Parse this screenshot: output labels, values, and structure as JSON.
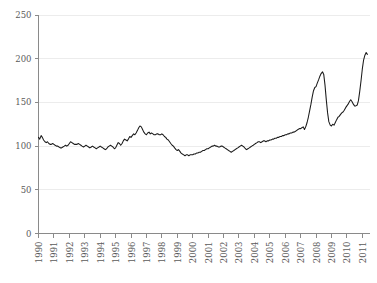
{
  "chart_data": {
    "type": "line",
    "title": "",
    "subtitle": "",
    "xlabel": "",
    "ylabel": "",
    "xlim": [
      1990,
      2011.5
    ],
    "ylim": [
      0,
      250
    ],
    "grid": true,
    "legend": "none",
    "y_ticks": [
      0,
      50,
      100,
      150,
      200,
      250
    ],
    "y_tick_labels": [
      "0",
      "50",
      "100",
      "150",
      "200",
      "250"
    ],
    "x_ticks": [
      1990,
      1991,
      1992,
      1993,
      1994,
      1995,
      1996,
      1997,
      1998,
      1999,
      2000,
      2001,
      2002,
      2003,
      2004,
      2005,
      2006,
      2007,
      2008,
      2009,
      2010,
      2011
    ],
    "x_tick_labels": [
      "1990",
      "1991",
      "1992",
      "1993",
      "1994",
      "1995",
      "1996",
      "1997",
      "1998",
      "1999",
      "2000",
      "2001",
      "2002",
      "2003",
      "2004",
      "2005",
      "2006",
      "2007",
      "2008",
      "2009",
      "2010",
      "2011"
    ],
    "series": [
      {
        "name": "index",
        "color": "#1a1a1a",
        "x": [
          1990.0,
          1990.08,
          1990.17,
          1990.25,
          1990.33,
          1990.42,
          1990.5,
          1990.58,
          1990.67,
          1990.75,
          1990.83,
          1990.92,
          1991.0,
          1991.08,
          1991.17,
          1991.25,
          1991.33,
          1991.42,
          1991.5,
          1991.58,
          1991.67,
          1991.75,
          1991.83,
          1991.92,
          1992.0,
          1992.08,
          1992.17,
          1992.25,
          1992.33,
          1992.42,
          1992.5,
          1992.58,
          1992.67,
          1992.75,
          1992.83,
          1992.92,
          1993.0,
          1993.08,
          1993.17,
          1993.25,
          1993.33,
          1993.42,
          1993.5,
          1993.58,
          1993.67,
          1993.75,
          1993.83,
          1993.92,
          1994.0,
          1994.08,
          1994.17,
          1994.25,
          1994.33,
          1994.42,
          1994.5,
          1994.58,
          1994.67,
          1994.75,
          1994.83,
          1994.92,
          1995.0,
          1995.08,
          1995.17,
          1995.25,
          1995.33,
          1995.42,
          1995.5,
          1995.58,
          1995.67,
          1995.75,
          1995.83,
          1995.92,
          1996.0,
          1996.08,
          1996.17,
          1996.25,
          1996.33,
          1996.42,
          1996.5,
          1996.58,
          1996.67,
          1996.75,
          1996.83,
          1996.92,
          1997.0,
          1997.08,
          1997.17,
          1997.25,
          1997.33,
          1997.42,
          1997.5,
          1997.58,
          1997.67,
          1997.75,
          1997.83,
          1997.92,
          1998.0,
          1998.08,
          1998.17,
          1998.25,
          1998.33,
          1998.42,
          1998.5,
          1998.58,
          1998.67,
          1998.75,
          1998.83,
          1998.92,
          1999.0,
          1999.08,
          1999.17,
          1999.25,
          1999.33,
          1999.42,
          1999.5,
          1999.58,
          1999.67,
          1999.75,
          1999.83,
          1999.92,
          2000.0,
          2000.08,
          2000.17,
          2000.25,
          2000.33,
          2000.42,
          2000.5,
          2000.58,
          2000.67,
          2000.75,
          2000.83,
          2000.92,
          2001.0,
          2001.08,
          2001.17,
          2001.25,
          2001.33,
          2001.42,
          2001.5,
          2001.58,
          2001.67,
          2001.75,
          2001.83,
          2001.92,
          2002.0,
          2002.08,
          2002.17,
          2002.25,
          2002.33,
          2002.42,
          2002.5,
          2002.58,
          2002.67,
          2002.75,
          2002.83,
          2002.92,
          2003.0,
          2003.08,
          2003.17,
          2003.25,
          2003.33,
          2003.42,
          2003.5,
          2003.58,
          2003.67,
          2003.75,
          2003.83,
          2003.92,
          2004.0,
          2004.08,
          2004.17,
          2004.25,
          2004.33,
          2004.42,
          2004.5,
          2004.58,
          2004.67,
          2004.75,
          2004.83,
          2004.92,
          2005.0,
          2005.08,
          2005.17,
          2005.25,
          2005.33,
          2005.42,
          2005.5,
          2005.58,
          2005.67,
          2005.75,
          2005.83,
          2005.92,
          2006.0,
          2006.08,
          2006.17,
          2006.25,
          2006.33,
          2006.42,
          2006.5,
          2006.58,
          2006.67,
          2006.75,
          2006.83,
          2006.92,
          2007.0,
          2007.08,
          2007.17,
          2007.25,
          2007.33,
          2007.42,
          2007.5,
          2007.58,
          2007.67,
          2007.75,
          2007.83,
          2007.92,
          2008.0,
          2008.08,
          2008.17,
          2008.25,
          2008.33,
          2008.42,
          2008.5,
          2008.58,
          2008.67,
          2008.75,
          2008.83,
          2008.92,
          2009.0,
          2009.08,
          2009.17,
          2009.25,
          2009.33,
          2009.42,
          2009.5,
          2009.58,
          2009.67,
          2009.75,
          2009.83,
          2009.92,
          2010.0,
          2010.08,
          2010.17,
          2010.25,
          2010.33,
          2010.42,
          2010.5,
          2010.58,
          2010.67,
          2010.75,
          2010.83,
          2010.92,
          2011.0,
          2011.08,
          2011.17,
          2011.25,
          2011.33
        ],
        "values": [
          110,
          108,
          112,
          110,
          107,
          105,
          104,
          105,
          103,
          102,
          102,
          103,
          102,
          101,
          100,
          100,
          99,
          98,
          98,
          99,
          100,
          101,
          100,
          101,
          103,
          105,
          104,
          103,
          102,
          102,
          102,
          103,
          102,
          101,
          100,
          99,
          100,
          101,
          100,
          99,
          98,
          99,
          100,
          99,
          98,
          97,
          98,
          99,
          100,
          99,
          98,
          97,
          96,
          97,
          99,
          100,
          101,
          100,
          99,
          97,
          98,
          101,
          104,
          103,
          101,
          103,
          106,
          108,
          107,
          106,
          108,
          111,
          110,
          112,
          114,
          113,
          115,
          118,
          121,
          123,
          122,
          119,
          116,
          114,
          113,
          115,
          116,
          114,
          115,
          114,
          113,
          113,
          114,
          114,
          113,
          113,
          114,
          113,
          111,
          110,
          108,
          107,
          105,
          103,
          101,
          100,
          98,
          96,
          95,
          96,
          94,
          92,
          91,
          90,
          89,
          90,
          90,
          89,
          90,
          90,
          90,
          91,
          91,
          92,
          92,
          93,
          93,
          94,
          95,
          95,
          96,
          97,
          97,
          98,
          99,
          100,
          100,
          101,
          100,
          100,
          99,
          99,
          100,
          100,
          99,
          98,
          97,
          96,
          95,
          94,
          93,
          94,
          95,
          96,
          97,
          98,
          99,
          100,
          101,
          100,
          99,
          97,
          96,
          97,
          98,
          99,
          100,
          101,
          102,
          103,
          104,
          105,
          105,
          104,
          105,
          106,
          106,
          105,
          106,
          106,
          107,
          107,
          108,
          108,
          109,
          109,
          110,
          110,
          111,
          111,
          112,
          112,
          113,
          113,
          114,
          114,
          115,
          115,
          116,
          116,
          117,
          118,
          119,
          120,
          120,
          121,
          122,
          119,
          122,
          127,
          133,
          140,
          148,
          156,
          163,
          167,
          168,
          172,
          176,
          180,
          183,
          185,
          182,
          170,
          152,
          138,
          128,
          124,
          123,
          125,
          124,
          127,
          130,
          133,
          134,
          136,
          138,
          139,
          141,
          144,
          146,
          148,
          151,
          153,
          151,
          148,
          146,
          146,
          147,
          152,
          162,
          175,
          188,
          198,
          204,
          207,
          205
        ]
      }
    ]
  }
}
